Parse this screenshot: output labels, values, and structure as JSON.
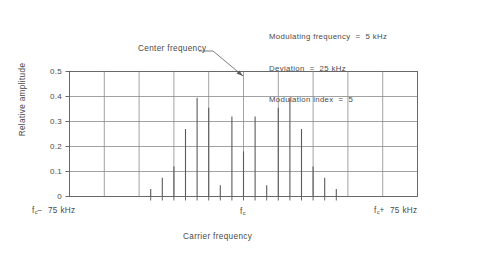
{
  "annotations": {
    "modulating_frequency": "Modulating frequency  =  5 kHz",
    "deviation": "Deviation  =  25 kHz",
    "modulation_index": "Modulation index  =  5",
    "center_frequency_label": "Center frequency"
  },
  "axes": {
    "ylabel": "Relative amplitude",
    "xlabel": "Carrier frequency",
    "ytick_labels": [
      "0.5",
      "0.4",
      "0.3",
      "0.2",
      "0.1",
      "0"
    ],
    "x_left_label_main": "f",
    "x_left_label_sub": "c",
    "x_left_label_rest": "−  75 kHz",
    "x_mid_label_main": "f",
    "x_mid_label_sub": "c",
    "x_right_label_main": "f",
    "x_right_label_sub": "c",
    "x_right_label_rest": "+  75 kHz"
  },
  "chart_data": {
    "type": "bar",
    "title": "",
    "subtitle": "",
    "xlabel": "Carrier frequency",
    "ylabel": "Relative amplitude",
    "ylim": [
      0,
      0.5
    ],
    "xlim": [
      -75,
      75
    ],
    "ytick_values": [
      0,
      0.1,
      0.2,
      0.3,
      0.4,
      0.5
    ],
    "ytick_labels": [
      "0",
      "0.1",
      "0.2",
      "0.3",
      "0.4",
      "0.5"
    ],
    "xtick_values": [
      -75,
      -60,
      -45,
      -30,
      -15,
      0,
      15,
      30,
      45,
      60,
      75
    ],
    "xtick_labels": [
      "f_c - 75 kHz",
      "",
      "",
      "",
      "",
      "f_c",
      "",
      "",
      "",
      "",
      "f_c + 75 kHz"
    ],
    "grid": true,
    "legend": false,
    "x_units": "kHz offset from carrier",
    "series_name": "FM sideband amplitudes (|J_n(5)|)",
    "x": [
      -40,
      -35,
      -30,
      -25,
      -20,
      -15,
      -10,
      -5,
      0,
      5,
      10,
      15,
      20,
      25,
      30,
      35,
      40
    ],
    "values": [
      0.03,
      0.075,
      0.12,
      0.27,
      0.395,
      0.355,
      0.045,
      0.32,
      0.18,
      0.32,
      0.045,
      0.355,
      0.395,
      0.27,
      0.12,
      0.075,
      0.03
    ],
    "harmonic_index": [
      -8,
      -7,
      -6,
      -5,
      -4,
      -3,
      -2,
      -1,
      0,
      1,
      2,
      3,
      4,
      5,
      6,
      7,
      8
    ],
    "annotations": [
      {
        "text": "Modulating frequency  =  5 kHz",
        "x": 40,
        "y": 0.62
      },
      {
        "text": "Deviation  =  25 kHz",
        "x": 40,
        "y": 0.58
      },
      {
        "text": "Modulation index  =  5",
        "x": 40,
        "y": 0.54
      },
      {
        "text": "Center frequency",
        "x": -22,
        "y": 0.52,
        "points_to": [
          0,
          0.45
        ]
      }
    ]
  }
}
